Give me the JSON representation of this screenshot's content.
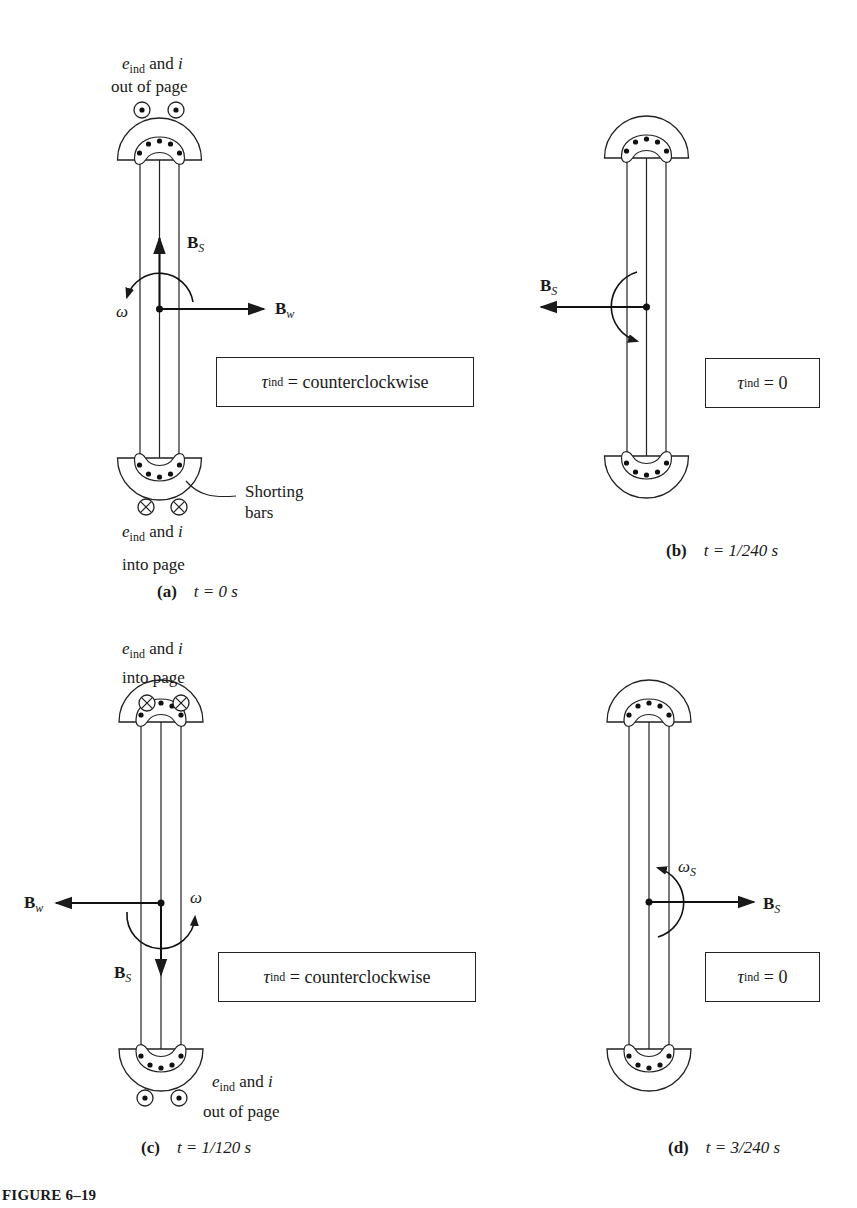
{
  "figure": {
    "title": "FIGURE 6–19"
  },
  "panels": [
    {
      "id": "a",
      "caption_letter": "(a)",
      "caption_time": "t = 0 s",
      "torque": {
        "symbol": "τ",
        "sub": "ind",
        "value": "= counterclockwise"
      },
      "top_current": {
        "e": "e",
        "e_sub": "ind",
        "and": "and",
        "i": "i",
        "direction": "out of page",
        "symbol": "dot"
      },
      "bottom_current": {
        "e": "e",
        "e_sub": "ind",
        "and": "and",
        "i": "i",
        "direction": "into page",
        "symbol": "cross"
      },
      "vectors": [
        {
          "name": "B",
          "sub": "S",
          "direction": "up"
        },
        {
          "name": "B",
          "sub": "w",
          "direction": "right"
        }
      ],
      "rotation_label": "ω",
      "annotation": {
        "line1": "Shorting",
        "line2": "bars"
      }
    },
    {
      "id": "b",
      "caption_letter": "(b)",
      "caption_time": "t = 1/240 s",
      "torque": {
        "symbol": "τ",
        "sub": "ind",
        "value": "= 0"
      },
      "vectors": [
        {
          "name": "B",
          "sub": "S",
          "direction": "left"
        }
      ]
    },
    {
      "id": "c",
      "caption_letter": "(c)",
      "caption_time": "t = 1/120 s",
      "torque": {
        "symbol": "τ",
        "sub": "ind",
        "value": "= counterclockwise"
      },
      "top_current": {
        "e": "e",
        "e_sub": "ind",
        "and": "and",
        "i": "i",
        "direction": "into page",
        "symbol": "cross"
      },
      "bottom_current": {
        "e": "e",
        "e_sub": "ind",
        "and": "and",
        "i": "i",
        "direction": "out of page",
        "symbol": "dot"
      },
      "vectors": [
        {
          "name": "B",
          "sub": "w",
          "direction": "left"
        },
        {
          "name": "B",
          "sub": "S",
          "direction": "down"
        }
      ],
      "rotation_label": "ω"
    },
    {
      "id": "d",
      "caption_letter": "(d)",
      "caption_time": "t = 3/240 s",
      "torque": {
        "symbol": "τ",
        "sub": "ind",
        "value": "= 0"
      },
      "vectors": [
        {
          "name": "B",
          "sub": "S",
          "direction": "right"
        }
      ],
      "rotation_label": "ω",
      "rotation_sub": "S"
    }
  ]
}
